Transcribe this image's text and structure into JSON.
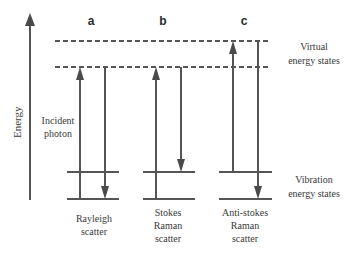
{
  "diagram": {
    "axis_label": "Energy",
    "columns": [
      {
        "id": "a",
        "label": "a",
        "caption": [
          "Rayleigh",
          "scatter"
        ]
      },
      {
        "id": "b",
        "label": "b",
        "caption": [
          "Stokes",
          "Raman",
          "scatter"
        ]
      },
      {
        "id": "c",
        "label": "c",
        "caption": [
          "Anti-stokes",
          "Raman",
          "scatter"
        ]
      }
    ],
    "incident_label": [
      "Incident",
      "photon"
    ],
    "virtual_label": [
      "Virtual",
      "energy states"
    ],
    "vibration_label": [
      "Vibration",
      "energy states"
    ],
    "colors": {
      "line": "#555555",
      "text": "#3a3a3a"
    }
  }
}
